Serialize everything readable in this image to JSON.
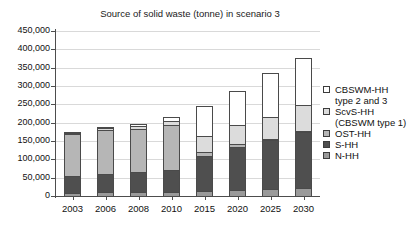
{
  "chart_data": {
    "type": "bar",
    "title": "Source of solid waste (tonne) in scenario 3",
    "xlabel": "",
    "ylabel": "",
    "ylim": [
      0,
      450000
    ],
    "ytick_step": 50000,
    "grid": true,
    "stacked": true,
    "legend_position": "right",
    "categories": [
      "2003",
      "2006",
      "2008",
      "2010",
      "2015",
      "2020",
      "2025",
      "2030"
    ],
    "ytick_labels": [
      "0",
      "50,000",
      "100,000",
      "150,000",
      "200,000",
      "250,000",
      "300,000",
      "350,000",
      "400,000",
      "450,000"
    ],
    "series": [
      {
        "name": "N-HH",
        "key": "nhh",
        "color": "#9a9a9a",
        "values": [
          12000,
          13000,
          14000,
          15000,
          17000,
          19000,
          22000,
          25000
        ]
      },
      {
        "name": "S-HH",
        "key": "shh",
        "color": "#4f4f4f",
        "values": [
          48000,
          52000,
          56000,
          62000,
          98000,
          120000,
          135000,
          155000
        ]
      },
      {
        "name": "OST-HH",
        "key": "ost",
        "color": "#b6b6b6",
        "values": [
          116000,
          122000,
          120000,
          124000,
          12000,
          10000,
          8000,
          6000
        ]
      },
      {
        "name": "ScvS-HH (CBSWM type 1)",
        "key": "scvs",
        "color": "#dcdcdc",
        "values": [
          8000,
          9000,
          12000,
          15000,
          48000,
          55000,
          62000,
          72000
        ]
      },
      {
        "name": "CBSWM-HH type 2 and 3",
        "key": "cbswm",
        "color": "#ffffff",
        "values": [
          4000,
          4000,
          8000,
          12000,
          85000,
          96000,
          123000,
          132000
        ]
      }
    ],
    "totals": [
      188000,
      200000,
      210000,
      228000,
      260000,
      300000,
      350000,
      390000
    ]
  },
  "legend": {
    "entries": [
      {
        "label_line1": "CBSWM-HH",
        "label_line2": "type 2 and 3",
        "swatch": "#ffffff"
      },
      {
        "label_line1": "ScvS-HH",
        "label_line2": "(CBSWM type 1)",
        "swatch": "#dcdcdc"
      },
      {
        "label_line1": "OST-HH",
        "label_line2": "",
        "swatch": "#b6b6b6"
      },
      {
        "label_line1": "S-HH",
        "label_line2": "",
        "swatch": "#4f4f4f"
      },
      {
        "label_line1": "N-HH",
        "label_line2": "",
        "swatch": "#9a9a9a"
      }
    ]
  }
}
